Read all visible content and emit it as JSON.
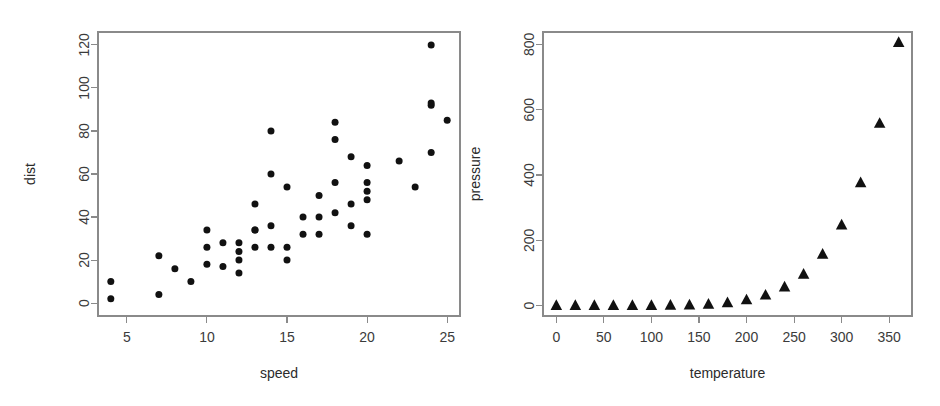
{
  "figure": {
    "background": "#ffffff",
    "marker_color": "#111111",
    "axis_color": "#8a8a8a",
    "text_color": "#3b3b3b",
    "panel_count": 2
  },
  "chart_data": [
    {
      "type": "scatter",
      "panel": "left",
      "title": "",
      "xlabel": "speed",
      "ylabel": "dist",
      "grid": false,
      "legend": "none",
      "marker": "filled-circle",
      "xlim": [
        3.2,
        25.8
      ],
      "ylim": [
        -6,
        126
      ],
      "xticks": [
        5,
        10,
        15,
        20,
        25
      ],
      "yticks": [
        0,
        20,
        40,
        60,
        80,
        100,
        120
      ],
      "xticklabels": [
        "5",
        "10",
        "15",
        "20",
        "25"
      ],
      "yticklabels": [
        "0",
        "20",
        "40",
        "60",
        "80",
        "100",
        "120"
      ],
      "x": [
        4,
        4,
        7,
        7,
        8,
        9,
        10,
        10,
        10,
        11,
        11,
        12,
        12,
        12,
        12,
        13,
        13,
        13,
        13,
        14,
        14,
        14,
        14,
        15,
        15,
        15,
        16,
        16,
        17,
        17,
        17,
        18,
        18,
        18,
        18,
        19,
        19,
        19,
        20,
        20,
        20,
        20,
        20,
        22,
        23,
        24,
        24,
        24,
        24,
        25
      ],
      "y": [
        2,
        10,
        4,
        22,
        16,
        10,
        18,
        26,
        34,
        17,
        28,
        14,
        20,
        24,
        28,
        26,
        34,
        34,
        46,
        26,
        36,
        60,
        80,
        20,
        26,
        54,
        32,
        40,
        32,
        40,
        50,
        42,
        56,
        76,
        84,
        36,
        46,
        68,
        32,
        48,
        52,
        56,
        64,
        66,
        54,
        70,
        92,
        93,
        120,
        85
      ]
    },
    {
      "type": "scatter",
      "panel": "right",
      "title": "",
      "xlabel": "temperature",
      "ylabel": "pressure",
      "grid": false,
      "legend": "none",
      "marker": "filled-triangle",
      "xlim": [
        -14,
        374
      ],
      "ylim": [
        -32,
        838
      ],
      "xticks": [
        0,
        50,
        100,
        150,
        200,
        250,
        300,
        350
      ],
      "yticks": [
        0,
        200,
        400,
        600,
        800
      ],
      "xticklabels": [
        "0",
        "50",
        "100",
        "150",
        "200",
        "250",
        "300",
        "350"
      ],
      "yticklabels": [
        "0",
        "200",
        "400",
        "600",
        "800"
      ],
      "x": [
        0,
        20,
        40,
        60,
        80,
        100,
        120,
        140,
        160,
        180,
        200,
        220,
        240,
        260,
        280,
        300,
        320,
        340,
        360
      ],
      "y": [
        0.0002,
        0.0012,
        0.006,
        0.03,
        0.09,
        0.27,
        0.75,
        1.85,
        4.2,
        8.8,
        17.3,
        32.1,
        57.0,
        96.0,
        157.0,
        247.0,
        376.0,
        558.0,
        806.0
      ]
    }
  ]
}
